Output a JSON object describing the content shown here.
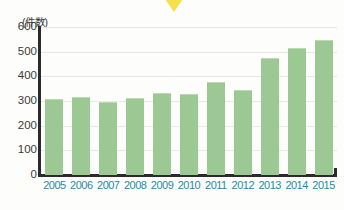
{
  "figure": {
    "unit_label": "(件数)",
    "marker": "yellow-down-triangle"
  },
  "chart_data": {
    "type": "bar",
    "title": "",
    "subtitle": "",
    "xlabel": "",
    "ylabel": "(件数)",
    "categories": [
      "2005",
      "2006",
      "2007",
      "2008",
      "2009",
      "2010",
      "2011",
      "2012",
      "2013",
      "2014",
      "2015"
    ],
    "values": [
      305,
      312,
      292,
      310,
      330,
      325,
      375,
      340,
      470,
      510,
      542
    ],
    "series": [
      {
        "name": "件数",
        "values": [
          305,
          312,
          292,
          310,
          330,
          325,
          375,
          340,
          470,
          510,
          542
        ]
      }
    ],
    "ylim": [
      0,
      600
    ],
    "yticks": [
      0,
      100,
      200,
      300,
      400,
      500,
      600
    ],
    "ytick_labels": [
      "0",
      "100",
      "200",
      "300",
      "400",
      "500",
      "600"
    ],
    "grid": true,
    "grid_axis": "y",
    "legend": false,
    "legend_position": "none",
    "bar_color": "#9cc894",
    "xtick_color": "#2f87a3",
    "ytick_color": "#3a3a38",
    "annotations": []
  }
}
